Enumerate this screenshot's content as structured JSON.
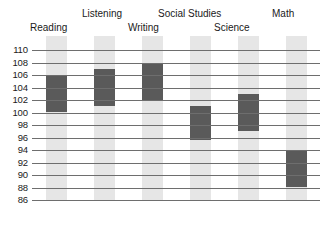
{
  "chart_data": {
    "type": "bar",
    "title": "",
    "subtitle": "",
    "xlabel": "",
    "ylabel": "",
    "ylim": [
      86,
      111
    ],
    "grid": true,
    "legend": null,
    "orientation": "vertical",
    "bar_style": "floating range bars over light background columns",
    "categories": [
      "Reading",
      "Listening",
      "Writing",
      "Social Studies",
      "Science",
      "Math"
    ],
    "y_ticks": [
      110,
      108,
      106,
      104,
      102,
      100,
      98,
      96,
      94,
      92,
      90,
      88,
      86
    ],
    "y_tick_labels": [
      "110",
      "108",
      "106",
      "104",
      "102",
      "100",
      "98",
      "96",
      "94",
      "92",
      "90",
      "88",
      "86"
    ],
    "series": [
      {
        "name": "Score range",
        "type": "range",
        "values": [
          {
            "category": "Reading",
            "low": 100.0,
            "high": 106.0
          },
          {
            "category": "Listening",
            "low": 101.0,
            "high": 107.0
          },
          {
            "category": "Writing",
            "low": 102.0,
            "high": 108.0
          },
          {
            "category": "Social Studies",
            "low": 95.5,
            "high": 101.0
          },
          {
            "category": "Science",
            "low": 97.0,
            "high": 103.0
          },
          {
            "category": "Math",
            "low": 88.0,
            "high": 94.0
          }
        ]
      }
    ]
  },
  "colors": {
    "bar_dark": "#5a5a5a",
    "column_light": "#e6e6e6",
    "gridline": "#6e6e6e",
    "text": "#1a1a1a",
    "background": "#ffffff"
  },
  "labels": {
    "reading": "Reading",
    "listening": "Listening",
    "writing": "Writing",
    "social_studies": "Social Studies",
    "science": "Science",
    "math": "Math"
  }
}
